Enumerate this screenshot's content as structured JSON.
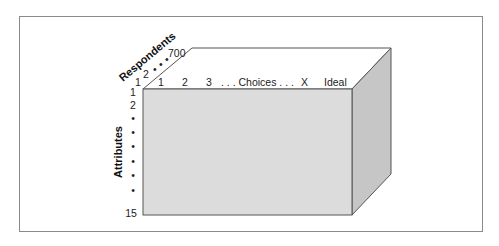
{
  "diagram": {
    "type": "data-cube",
    "colors": {
      "front_face": "#dcdcdc",
      "right_face": "#c6c6c6",
      "top_face": "#ffffff",
      "edge": "#555555",
      "frame": "#8a8a8a"
    },
    "axes": {
      "respondents": {
        "title": "Respondents",
        "labels": [
          "1",
          "2",
          "•",
          "•",
          "•",
          "700"
        ]
      },
      "choices": {
        "labels": [
          "1",
          "2",
          "3",
          ". . . Choices . . .",
          "X",
          "Ideal"
        ]
      },
      "attributes": {
        "title": "Attributes",
        "labels": [
          "1",
          "2",
          "•",
          "•",
          "•",
          "•",
          "•",
          "•",
          "15"
        ]
      }
    }
  }
}
